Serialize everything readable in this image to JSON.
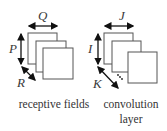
{
  "left_group": {
    "width_label": "Q",
    "height_label": "P",
    "depth_label": "R",
    "caption": "receptive fields"
  },
  "right_group": {
    "width_label": "J",
    "height_label": "I",
    "depth_label": "K",
    "ellipsis": "...",
    "caption_line1": "convolution",
    "caption_line2": "layer"
  },
  "colors": {
    "stroke": "#555555",
    "arrow": "#111111",
    "fill": "#ffffff"
  }
}
